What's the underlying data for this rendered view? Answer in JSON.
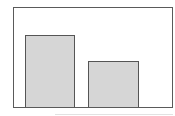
{
  "chart_data": {
    "type": "bar",
    "title": "",
    "xlabel": "",
    "ylabel": "",
    "categories": [
      "",
      ""
    ],
    "values": [
      73,
      46
    ],
    "ylim": [
      0,
      100
    ],
    "grid": false,
    "legend": null,
    "colors": {
      "bar_fill": "#d6d6d6",
      "bar_edge": "#555555",
      "frame": "#5a5a5a"
    }
  }
}
